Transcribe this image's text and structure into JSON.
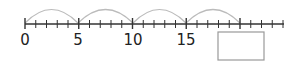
{
  "number_line": {
    "start": 0,
    "step_per_tick": 1,
    "ticks": 24,
    "labels": [
      "0",
      "5",
      "10",
      "15"
    ],
    "jumps": [
      {
        "from": 0,
        "to": 5
      },
      {
        "from": 5,
        "to": 10
      },
      {
        "from": 10,
        "to": 15
      },
      {
        "from": 15,
        "to": 20
      }
    ],
    "answer_box": {
      "value": "",
      "position": 20
    }
  },
  "colors": {
    "line": "#333333",
    "arc": "#bbbbbb",
    "box_border": "#999999"
  }
}
